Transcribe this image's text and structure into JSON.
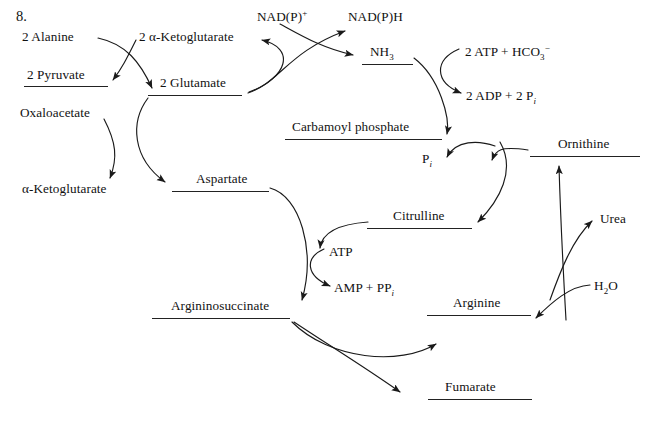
{
  "page": {
    "item_number": "8.",
    "background": "#ffffff",
    "ink_color": "#111111",
    "width": 655,
    "height": 421,
    "diagram_title": "Urea cycle and amino acid nitrogen transfer"
  },
  "nodes": [
    {
      "id": "alanine",
      "label": "2 Alanine",
      "x": 22,
      "y": 30,
      "underline": false,
      "rule": null
    },
    {
      "id": "pyruvate",
      "label": "2 Pyruvate",
      "x": 27,
      "y": 68,
      "underline": true,
      "rule": {
        "x": 24,
        "y": 86,
        "w": 84
      }
    },
    {
      "id": "oxaloacetate",
      "label": "Oxaloacetate",
      "x": 20,
      "y": 106,
      "underline": false,
      "rule": null
    },
    {
      "id": "alpha-ketoglutarate-bottom",
      "label": "α-Ketoglutarate",
      "x": 22,
      "y": 182,
      "underline": false,
      "rule": null
    },
    {
      "id": "alpha-ketoglutarate-top",
      "label": "2 α-Ketoglutarate",
      "x": 139,
      "y": 30,
      "underline": false,
      "rule": null
    },
    {
      "id": "glutamate",
      "label": "2 Glutamate",
      "x": 160,
      "y": 76,
      "underline": true,
      "rule": {
        "x": 148,
        "y": 95,
        "w": 94
      }
    },
    {
      "id": "aspartate",
      "label": "Aspartate",
      "x": 196,
      "y": 172,
      "underline": true,
      "rule": {
        "x": 172,
        "y": 191,
        "w": 97
      }
    },
    {
      "id": "argininosuccinate",
      "label": "Argininosuccinate",
      "x": 171,
      "y": 299,
      "underline": true,
      "rule": {
        "x": 152,
        "y": 318,
        "w": 138
      }
    },
    {
      "id": "nadp-plus",
      "label": "NAD(P)",
      "sup": "+",
      "x": 257,
      "y": 10,
      "underline": false,
      "rule": null
    },
    {
      "id": "nadph",
      "label": "NAD(P)H",
      "x": 348,
      "y": 10,
      "underline": false,
      "rule": null
    },
    {
      "id": "ammonia",
      "label": "NH",
      "sub": "3",
      "x": 370,
      "y": 45,
      "underline": true,
      "rule": {
        "x": 362,
        "y": 64,
        "w": 51
      }
    },
    {
      "id": "atp-bicarbonate",
      "label": "2 ATP + HCO",
      "sub": "3",
      "sup_after": "−",
      "x": 465,
      "y": 45,
      "underline": false,
      "rule": null
    },
    {
      "id": "adp-phosphate",
      "label": "2 ADP + 2 P",
      "sub_ital": "i",
      "x": 466,
      "y": 89,
      "underline": false,
      "rule": null
    },
    {
      "id": "carbamoyl-phosphate",
      "label": "Carbamoyl phosphate",
      "x": 292,
      "y": 120,
      "underline": true,
      "rule": {
        "x": 285,
        "y": 139,
        "w": 157
      }
    },
    {
      "id": "pi",
      "label": "P",
      "sub_ital": "i",
      "x": 422,
      "y": 152,
      "underline": false,
      "rule": null
    },
    {
      "id": "citrulline",
      "label": "Citrulline",
      "x": 393,
      "y": 209,
      "underline": true,
      "rule": {
        "x": 367,
        "y": 228,
        "w": 105
      }
    },
    {
      "id": "ornithine",
      "label": "Ornithine",
      "x": 558,
      "y": 137,
      "underline": true,
      "rule": {
        "x": 530,
        "y": 156,
        "w": 110
      }
    },
    {
      "id": "urea",
      "label": "Urea",
      "x": 600,
      "y": 212,
      "underline": false,
      "rule": null
    },
    {
      "id": "water",
      "label": "H",
      "sub": "2",
      "label_after": "O",
      "x": 594,
      "y": 279,
      "underline": false,
      "rule": null
    },
    {
      "id": "atp",
      "label": "ATP",
      "x": 329,
      "y": 245,
      "underline": false,
      "rule": null
    },
    {
      "id": "amp-ppi",
      "label": "AMP + PP",
      "sub_ital": "i",
      "x": 334,
      "y": 281,
      "underline": false,
      "rule": null
    },
    {
      "id": "arginine",
      "label": "Arginine",
      "x": 453,
      "y": 296,
      "underline": true,
      "rule": {
        "x": 427,
        "y": 315,
        "w": 104
      }
    },
    {
      "id": "fumarate",
      "label": "Fumarate",
      "x": 445,
      "y": 380,
      "underline": true,
      "rule": {
        "x": 428,
        "y": 399,
        "w": 104
      }
    }
  ],
  "arrows": [
    {
      "id": "alanine-to-glutamate",
      "from": "alanine",
      "to": "glutamate",
      "d": "M 98 38 C 126 44 140 62 152 88"
    },
    {
      "id": "aketoglutarate-to-pyruvate",
      "from": "alpha-ketoglutarate-top",
      "to": "pyruvate",
      "d": "M 136 40 C 126 60 122 68 113 80"
    },
    {
      "id": "oxaloacetate-to-aketo",
      "from": "oxaloacetate",
      "to": "alpha-ketoglutarate-bottom",
      "d": "M 104 119 C 116 142 118 158 110 178"
    },
    {
      "id": "glutamate-to-aspartate",
      "from": "glutamate",
      "to": "aspartate",
      "d": "M 148 98 C 130 122 132 158 165 182"
    },
    {
      "id": "nadp-to-ammonia",
      "from": "nadp-plus",
      "to": "ammonia",
      "d": "M 280 24 C 302 36 322 48 353 55"
    },
    {
      "id": "glutamate-to-nadph",
      "from": "glutamate",
      "to": "nadph",
      "d": "M 248 93 C 280 82 288 52 345 31"
    },
    {
      "id": "glutamate-loop",
      "from": "glutamate",
      "to": "aketoglutarate-top",
      "d": "M 249 92 C 288 78 296 48 262 40"
    },
    {
      "id": "ammonia-to-carbamoyl",
      "from": "ammonia",
      "to": "carbamoyl-phosphate",
      "d": "M 414 58 C 440 78 450 118 447 134"
    },
    {
      "id": "atp-to-adp",
      "from": "atp-bicarbonate",
      "to": "adp-phosphate",
      "d": "M 459 49 C 434 60 434 82 461 93"
    },
    {
      "id": "carbamoyl-to-citrulline",
      "from": "carbamoyl-phosphate",
      "to": "citrulline",
      "d": "M 500 142 C 516 170 500 200 478 222"
    },
    {
      "id": "ornithine-to-citrulline",
      "from": "ornithine",
      "to": "citrulline",
      "d": "M 528 150 C 500 146 496 150 492 160"
    },
    {
      "id": "citrulline-loop-pi",
      "from": "citrulline",
      "to": "pi",
      "d": "M 495 146 C 478 140 456 140 447 157"
    },
    {
      "id": "aspartate-to-argininosuccinate",
      "from": "aspartate",
      "to": "argininosuccinate",
      "d": "M 270 188 C 300 196 316 250 302 300"
    },
    {
      "id": "atp-to-amp",
      "from": "atp",
      "to": "amp-ppi",
      "d": "M 324 249 C 304 258 306 276 330 286"
    },
    {
      "id": "citrulline-to-atp",
      "from": "citrulline",
      "to": "atp",
      "d": "M 368 222 C 340 224 322 232 320 248"
    },
    {
      "id": "argininosuccinate-to-arginine",
      "from": "argininosuccinate",
      "to": "arginine",
      "d": "M 292 322 C 330 360 400 366 436 344"
    },
    {
      "id": "argininosuccinate-to-fumarate",
      "from": "argininosuccinate",
      "to": "fumarate",
      "d": "M 294 322 C 330 346 360 364 400 392"
    },
    {
      "id": "arginine-to-ornithine",
      "from": "arginine",
      "to": "ornithine",
      "d": "M 566 320 C 562 250 560 200 559 166"
    },
    {
      "id": "water-to-arginine",
      "from": "water",
      "to": "arginine",
      "d": "M 590 285 C 570 286 552 302 536 318"
    },
    {
      "id": "arginine-to-urea",
      "from": "arginine",
      "to": "urea",
      "d": "M 550 300 C 560 272 572 240 592 221"
    }
  ]
}
